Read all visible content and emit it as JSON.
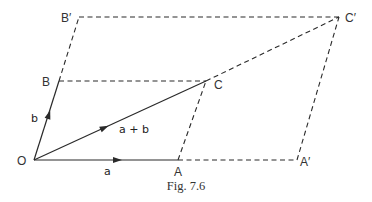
{
  "figure": {
    "caption": "Fig. 7.6",
    "points": {
      "O": {
        "label": "O",
        "x": 34,
        "y": 160
      },
      "A": {
        "label": "A",
        "x": 178,
        "y": 160
      },
      "A_prime": {
        "label": "A′",
        "x": 297,
        "y": 160
      },
      "B": {
        "label": "B",
        "x": 59,
        "y": 81
      },
      "C": {
        "label": "C",
        "x": 206,
        "y": 81
      },
      "B_prime": {
        "label": "B′",
        "x": 79,
        "y": 17
      },
      "C_prime": {
        "label": "C′",
        "x": 339,
        "y": 17
      }
    },
    "vectors": {
      "a": {
        "label": "a"
      },
      "b": {
        "label": "b"
      },
      "a_plus_b": {
        "label": "a + b"
      }
    },
    "line_color": "#2a2a2a"
  }
}
